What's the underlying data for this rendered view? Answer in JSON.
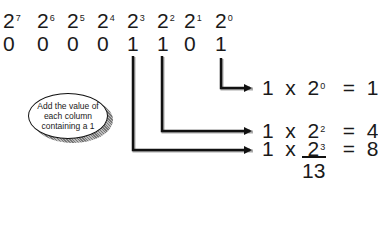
{
  "powers": [
    {
      "base": "2",
      "exp": "7"
    },
    {
      "base": "2",
      "exp": "6"
    },
    {
      "base": "2",
      "exp": "5"
    },
    {
      "base": "2",
      "exp": "4"
    },
    {
      "base": "2",
      "exp": "3"
    },
    {
      "base": "2",
      "exp": "2"
    },
    {
      "base": "2",
      "exp": "1"
    },
    {
      "base": "2",
      "exp": "0"
    }
  ],
  "bits": [
    "0",
    "0",
    "0",
    "0",
    "1",
    "1",
    "0",
    "1"
  ],
  "callout": {
    "text": "Add the value of each column containing a 1"
  },
  "equations": [
    {
      "coef": "1",
      "op": "x",
      "base": "2",
      "exp": "0",
      "eq": "=",
      "result": "1"
    },
    {
      "coef": "1",
      "op": "x",
      "base": "2",
      "exp": "2",
      "eq": "=",
      "result": "4"
    },
    {
      "coef": "1",
      "op": "x",
      "base": "2",
      "exp": "3",
      "eq": "=",
      "result": "8"
    }
  ],
  "total": "13"
}
